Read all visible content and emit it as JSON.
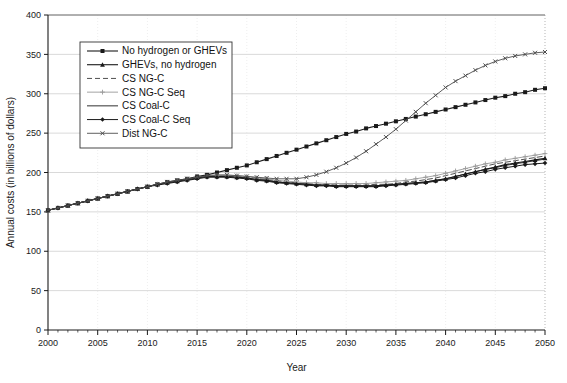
{
  "chart_data": {
    "type": "line",
    "title": "",
    "xlabel": "Year",
    "ylabel": "Annual costs (in billions of dollars)",
    "xlim": [
      2000,
      2050
    ],
    "ylim": [
      0,
      400
    ],
    "xticks": [
      2000,
      2005,
      2010,
      2015,
      2020,
      2025,
      2030,
      2035,
      2040,
      2045,
      2050
    ],
    "yticks": [
      0,
      50,
      100,
      150,
      200,
      250,
      300,
      350,
      400
    ],
    "xtick_labels": [
      "2000",
      "2005",
      "2010",
      "2015",
      "2020",
      "2025",
      "2030",
      "2035",
      "2040",
      "2045",
      "2050"
    ],
    "ytick_labels": [
      "0",
      "50",
      "100",
      "150",
      "200",
      "250",
      "300",
      "350",
      "400"
    ],
    "xtick_minor_step": 1,
    "grid": "horizontal",
    "legend_position": "upper-left-inside",
    "x": [
      2000,
      2001,
      2002,
      2003,
      2004,
      2005,
      2006,
      2007,
      2008,
      2009,
      2010,
      2011,
      2012,
      2013,
      2014,
      2015,
      2016,
      2017,
      2018,
      2019,
      2020,
      2021,
      2022,
      2023,
      2024,
      2025,
      2026,
      2027,
      2028,
      2029,
      2030,
      2031,
      2032,
      2033,
      2034,
      2035,
      2036,
      2037,
      2038,
      2039,
      2040,
      2041,
      2042,
      2043,
      2044,
      2045,
      2046,
      2047,
      2048,
      2049,
      2050
    ],
    "series": [
      {
        "name": "No hydrogen or GHEVs",
        "marker": "square",
        "color": "#1a1a1a",
        "dash": "none",
        "width": 1.1,
        "values": [
          152,
          155,
          158,
          161,
          164,
          167,
          170,
          173,
          176,
          179,
          182,
          185,
          188,
          190,
          192,
          195,
          197,
          200,
          203,
          206,
          209,
          213,
          217,
          221,
          225,
          229,
          233,
          237,
          241,
          245,
          249,
          252,
          256,
          259,
          262,
          265,
          268,
          271,
          274,
          277,
          280,
          283,
          286,
          289,
          292,
          295,
          297,
          300,
          302,
          305,
          307
        ]
      },
      {
        "name": "GHEVs, no hydrogen",
        "marker": "triangle",
        "color": "#1a1a1a",
        "dash": "none",
        "width": 1.1,
        "values": [
          152,
          155,
          158,
          161,
          164,
          167,
          170,
          173,
          176,
          179,
          182,
          185,
          187,
          189,
          191,
          193,
          195,
          195,
          195,
          194,
          193,
          191,
          190,
          188,
          187,
          186,
          185,
          184,
          184,
          183,
          183,
          183,
          183,
          183,
          184,
          185,
          186,
          187,
          188,
          190,
          192,
          195,
          198,
          201,
          204,
          207,
          210,
          212,
          214,
          216,
          218
        ]
      },
      {
        "name": "CS NG-C",
        "marker": "none",
        "color": "#3c3c3c",
        "dash": "5,3",
        "width": 0.9,
        "values": [
          152,
          155,
          158,
          161,
          164,
          167,
          170,
          173,
          176,
          179,
          182,
          185,
          187,
          189,
          191,
          193,
          195,
          196,
          196,
          195,
          194,
          193,
          191,
          190,
          188,
          187,
          186,
          185,
          185,
          184,
          184,
          184,
          184,
          185,
          185,
          186,
          188,
          189,
          191,
          193,
          196,
          199,
          202,
          205,
          208,
          211,
          213,
          215,
          217,
          219,
          221
        ]
      },
      {
        "name": "CS NG-C Seq",
        "marker": "plus",
        "color": "#9a9a9a",
        "dash": "none",
        "width": 0.9,
        "values": [
          152,
          155,
          158,
          161,
          164,
          167,
          170,
          173,
          176,
          179,
          182,
          185,
          187,
          189,
          191,
          193,
          195,
          196,
          196,
          196,
          195,
          193,
          192,
          190,
          189,
          188,
          187,
          187,
          186,
          186,
          186,
          186,
          186,
          187,
          188,
          189,
          190,
          192,
          194,
          196,
          199,
          202,
          205,
          208,
          211,
          213,
          216,
          218,
          220,
          222,
          224
        ]
      },
      {
        "name": "CS Coal-C",
        "marker": "none",
        "color": "#1a1a1a",
        "dash": "none",
        "width": 0.9,
        "values": [
          152,
          155,
          158,
          161,
          164,
          167,
          170,
          173,
          176,
          179,
          182,
          185,
          187,
          189,
          191,
          193,
          195,
          195,
          195,
          194,
          193,
          191,
          190,
          188,
          187,
          186,
          185,
          184,
          184,
          183,
          183,
          183,
          183,
          183,
          184,
          185,
          186,
          187,
          188,
          190,
          192,
          195,
          198,
          201,
          204,
          206,
          209,
          211,
          213,
          215,
          217
        ]
      },
      {
        "name": "CS Coal-C Seq",
        "marker": "diamond",
        "color": "#1a1a1a",
        "dash": "none",
        "width": 1.0,
        "values": [
          152,
          155,
          158,
          161,
          164,
          167,
          170,
          173,
          176,
          179,
          182,
          184,
          186,
          188,
          190,
          192,
          194,
          194,
          194,
          193,
          192,
          190,
          189,
          187,
          186,
          185,
          184,
          183,
          183,
          182,
          182,
          182,
          182,
          182,
          183,
          184,
          185,
          186,
          187,
          189,
          191,
          193,
          196,
          199,
          201,
          204,
          206,
          208,
          210,
          211,
          212
        ]
      },
      {
        "name": "Dist NG-C",
        "marker": "cross",
        "color": "#4d4d4d",
        "dash": "none",
        "width": 0.9,
        "values": [
          152,
          155,
          158,
          161,
          164,
          167,
          170,
          173,
          176,
          179,
          182,
          185,
          188,
          190,
          192,
          194,
          196,
          197,
          197,
          196,
          195,
          194,
          193,
          192,
          192,
          192,
          194,
          197,
          201,
          206,
          212,
          219,
          227,
          236,
          245,
          255,
          266,
          277,
          288,
          298,
          308,
          316,
          323,
          330,
          336,
          341,
          345,
          348,
          350,
          352,
          353
        ]
      }
    ]
  },
  "legend": {
    "items": [
      {
        "label": "No hydrogen or GHEVs"
      },
      {
        "label": "GHEVs, no hydrogen"
      },
      {
        "label": "CS NG-C"
      },
      {
        "label": "CS NG-C Seq"
      },
      {
        "label": "CS Coal-C"
      },
      {
        "label": "CS Coal-C Seq"
      },
      {
        "label": "Dist NG-C"
      }
    ]
  },
  "colors": {
    "axis": "#1a1a1a",
    "grid": "#c8c8c8",
    "background": "#ffffff"
  }
}
